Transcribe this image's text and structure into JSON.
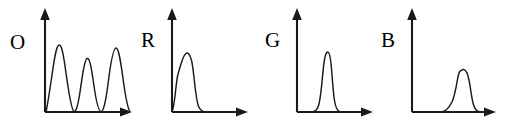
{
  "figure": {
    "background_color": "#ffffff",
    "ink_color": "#1a1a1a",
    "panel_count": 4
  },
  "panels": [
    {
      "label": "O",
      "label_x": 10,
      "label_y": 32,
      "origin_x": 45,
      "origin_y": 112,
      "y_axis_top": 12,
      "x_axis_right": 131,
      "peaks": 3
    },
    {
      "label": "R",
      "label_x": 141,
      "label_y": 30,
      "origin_x": 172,
      "origin_y": 112,
      "y_axis_top": 12,
      "x_axis_right": 247,
      "peaks": 1
    },
    {
      "label": "G",
      "label_x": 265,
      "label_y": 30,
      "origin_x": 297,
      "origin_y": 112,
      "y_axis_top": 12,
      "x_axis_right": 372,
      "peaks": 1
    },
    {
      "label": "B",
      "label_x": 381,
      "label_y": 30,
      "origin_x": 412,
      "origin_y": 112,
      "y_axis_top": 12,
      "x_axis_right": 497,
      "peaks": 1
    }
  ],
  "chart_data": [
    {
      "type": "line",
      "title": "O",
      "xlabel": "",
      "ylabel": "",
      "grid": false,
      "legend": false,
      "xlim": [
        0,
        100
      ],
      "ylim": [
        0,
        100
      ],
      "series": [
        {
          "name": "O",
          "description": "Three broad overlapping emission peaks spanning the full horizontal range; first and third peaks tall, middle peak lower.",
          "peaks": [
            {
              "center": 16,
              "height": 78,
              "width": 13
            },
            {
              "center": 48,
              "height": 62,
              "width": 12
            },
            {
              "center": 79,
              "height": 75,
              "width": 14
            }
          ],
          "x": [
            0,
            4,
            8,
            12,
            16,
            20,
            24,
            28,
            32,
            36,
            40,
            44,
            48,
            52,
            56,
            60,
            64,
            68,
            72,
            76,
            80,
            84,
            88,
            92,
            96,
            100
          ],
          "y": [
            2,
            4,
            18,
            52,
            78,
            52,
            18,
            4,
            2,
            3,
            12,
            40,
            62,
            40,
            12,
            3,
            2,
            4,
            16,
            50,
            75,
            58,
            28,
            12,
            5,
            2
          ]
        }
      ]
    },
    {
      "type": "line",
      "title": "R",
      "xlabel": "",
      "ylabel": "",
      "grid": false,
      "legend": false,
      "xlim": [
        0,
        100
      ],
      "ylim": [
        0,
        100
      ],
      "series": [
        {
          "name": "R",
          "description": "Single narrow tall peak close to the vertical axis, with a small shoulder on its left flank and a long low tail to the right.",
          "peaks": [
            {
              "center": 12,
              "height": 76,
              "width": 8
            }
          ],
          "x": [
            0,
            4,
            8,
            12,
            16,
            20,
            24,
            28,
            32,
            36,
            40,
            50,
            60,
            70,
            80,
            90,
            100
          ],
          "y": [
            2,
            14,
            52,
            76,
            62,
            28,
            10,
            4,
            2,
            1,
            1,
            1,
            1,
            1,
            1,
            1,
            1
          ]
        }
      ]
    },
    {
      "type": "line",
      "title": "G",
      "xlabel": "",
      "ylabel": "",
      "grid": false,
      "legend": false,
      "xlim": [
        0,
        100
      ],
      "ylim": [
        0,
        100
      ],
      "series": [
        {
          "name": "G",
          "description": "Single narrow tall peak positioned left of center, symmetric with short tails.",
          "peaks": [
            {
              "center": 40,
              "height": 78,
              "width": 8
            }
          ],
          "x": [
            0,
            10,
            20,
            26,
            32,
            36,
            40,
            44,
            48,
            54,
            60,
            70,
            80,
            90,
            100
          ],
          "y": [
            1,
            1,
            3,
            10,
            38,
            68,
            78,
            66,
            36,
            10,
            3,
            1,
            1,
            1,
            1
          ]
        }
      ]
    },
    {
      "type": "line",
      "title": "B",
      "xlabel": "",
      "ylabel": "",
      "grid": false,
      "legend": false,
      "xlim": [
        0,
        100
      ],
      "ylim": [
        0,
        100
      ],
      "series": [
        {
          "name": "B",
          "description": "Single peak located toward the right side, shorter and slightly broader than R and G, with a low rising shoulder on the left.",
          "peaks": [
            {
              "center": 69,
              "height": 58,
              "width": 10
            }
          ],
          "x": [
            0,
            10,
            20,
            30,
            40,
            48,
            55,
            60,
            64,
            69,
            73,
            78,
            84,
            90,
            96,
            100
          ],
          "y": [
            1,
            1,
            1,
            1,
            2,
            5,
            12,
            26,
            48,
            58,
            50,
            26,
            8,
            3,
            1,
            1
          ]
        }
      ]
    }
  ]
}
